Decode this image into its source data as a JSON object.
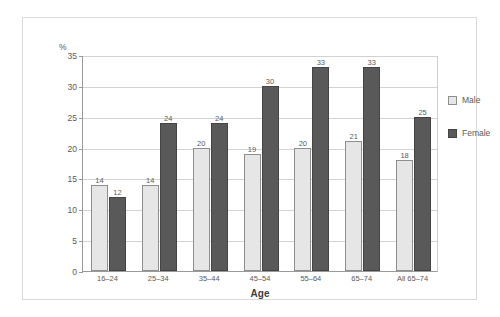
{
  "chart_data": {
    "type": "bar",
    "title": "",
    "xlabel": "Age",
    "ylabel": "%",
    "ylim": [
      0,
      35
    ],
    "yticks": [
      0,
      5,
      10,
      15,
      20,
      25,
      30,
      35
    ],
    "grid": true,
    "legend_position": "right",
    "categories": [
      "16–24",
      "25–34",
      "35–44",
      "45–54",
      "55–64",
      "65–74",
      "All 65–74"
    ],
    "series": [
      {
        "name": "Male",
        "color": "#e6e6e6",
        "values": [
          14,
          14,
          20,
          19,
          20,
          21,
          18
        ]
      },
      {
        "name": "Female",
        "color": "#595959",
        "values": [
          12,
          24,
          24,
          30,
          33,
          33,
          25
        ]
      }
    ]
  },
  "axis": {
    "y_unit": "%",
    "y_tick_labels": [
      "35",
      "30",
      "25",
      "20",
      "15",
      "10",
      "5",
      "0"
    ],
    "x_title": "Age"
  },
  "legend": {
    "items": [
      {
        "label": "Male"
      },
      {
        "label": "Female"
      }
    ]
  },
  "footer": {
    "caption": ""
  }
}
